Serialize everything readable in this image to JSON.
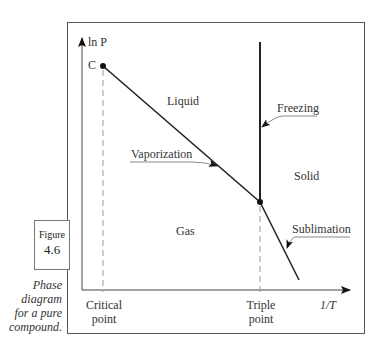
{
  "figure": {
    "label": "Figure",
    "number": "4.6",
    "caption_lines": [
      "Phase",
      "diagram",
      "for a pure",
      "compound."
    ]
  },
  "axes": {
    "y_label": "ln P",
    "x_label": "1/T"
  },
  "points": {
    "critical_marker": "C",
    "critical_label_lines": [
      "Critical",
      "point"
    ],
    "triple_label_lines": [
      "Triple",
      "point"
    ]
  },
  "regions": {
    "liquid": "Liquid",
    "gas": "Gas",
    "solid": "Solid"
  },
  "curves": {
    "vaporization": "Vaporization",
    "freezing": "Freezing",
    "sublimation": "Sublimation"
  },
  "colors": {
    "line": "#222222",
    "dashed": "#999999",
    "frame": "#555555"
  }
}
